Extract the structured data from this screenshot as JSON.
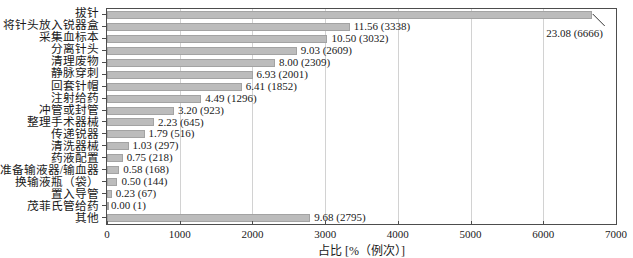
{
  "chart_data": {
    "type": "bar",
    "orientation": "horizontal",
    "title": "",
    "xlabel": "占比 [%（例次）]",
    "xlim": [
      0,
      7000
    ],
    "xticks": [
      0,
      1000,
      2000,
      3000,
      4000,
      5000,
      6000,
      7000
    ],
    "grid": "vertical-light",
    "legend": "none",
    "bar_color": "#bcbcbc",
    "value_label_format": "percent (count)",
    "bars": [
      {
        "label": "拔针",
        "pct": "23.08",
        "count": 6666,
        "annotate": true
      },
      {
        "label": "将针头放入锐器盒",
        "pct": "11.56",
        "count": 3338
      },
      {
        "label": "采集血标本",
        "pct": "10.50",
        "count": 3032
      },
      {
        "label": "分离针头",
        "pct": "9.03",
        "count": 2609
      },
      {
        "label": "清理废物",
        "pct": "8.00",
        "count": 2309
      },
      {
        "label": "静脉穿刺",
        "pct": "6.93",
        "count": 2001
      },
      {
        "label": "回套针帽",
        "pct": "6.41",
        "count": 1852
      },
      {
        "label": "注射给药",
        "pct": "4.49",
        "count": 1296
      },
      {
        "label": "冲管或封管",
        "pct": "3.20",
        "count": 923
      },
      {
        "label": "整理手术器械",
        "pct": "2.23",
        "count": 645
      },
      {
        "label": "传递锐器",
        "pct": "1.79",
        "count": 516
      },
      {
        "label": "清洗器械",
        "pct": "1.03",
        "count": 297
      },
      {
        "label": "药液配置",
        "pct": "0.75",
        "count": 218
      },
      {
        "label": "准备输液器/输血器",
        "pct": "0.58",
        "count": 168
      },
      {
        "label": "换输液瓶（袋）",
        "pct": "0.50",
        "count": 144
      },
      {
        "label": "置入导管",
        "pct": "0.23",
        "count": 67
      },
      {
        "label": "茂菲氏管给药",
        "pct": "0.00",
        "count": 1
      },
      {
        "label": "其他",
        "pct": "9.68",
        "count": 2795
      }
    ]
  }
}
